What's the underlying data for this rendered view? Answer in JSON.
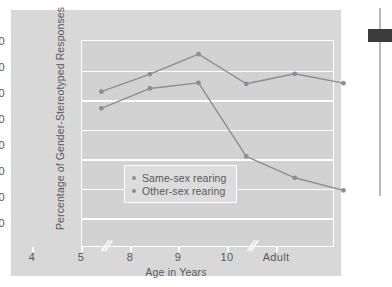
{
  "chart_data": {
    "type": "line",
    "title": "",
    "xlabel": "Age in Years",
    "ylabel": "Percentage of Gender-Stereotyped Responses",
    "categories": [
      "4",
      "5",
      "8",
      "9",
      "10",
      "Adult"
    ],
    "ylim": [
      20,
      90
    ],
    "yticks": [
      90,
      80,
      70,
      60,
      50,
      40,
      30,
      20
    ],
    "grid": true,
    "axis_breaks": [
      "between 5 and 8",
      "between 10 and Adult"
    ],
    "legend_position": "inside-lower-left",
    "series": [
      {
        "name": "Same-sex rearing",
        "color": "#8d8d92",
        "values": [
          67.0,
          73.8,
          75.7,
          50.6,
          43.3,
          39.0
        ]
      },
      {
        "name": "Other-sex rearing",
        "color": "#8d8d92",
        "values": [
          72.7,
          78.7,
          85.5,
          75.4,
          78.8,
          75.6
        ]
      }
    ]
  },
  "legend": {
    "items": [
      {
        "label": "Same-sex rearing"
      },
      {
        "label": "Other-sex rearing"
      }
    ]
  },
  "axes": {
    "y_tick_labels": [
      "90",
      "80",
      "70",
      "60",
      "50",
      "40",
      "30",
      "20"
    ],
    "x_tick_labels": [
      "4",
      "5",
      "8",
      "9",
      "10",
      "Adult"
    ],
    "break_glyph": "//"
  },
  "colors": {
    "figure_background": "#d8d8d8",
    "plot_background": "#d2d2d2",
    "gridline": "#ffffff",
    "line": "#8d8d92",
    "text": "#58585a",
    "scrollbar_thumb": "#3b3b3b",
    "scrollbar_track": "#b9b9b9"
  },
  "scrollbar": {
    "thumb_label": "scroll-thumb"
  }
}
